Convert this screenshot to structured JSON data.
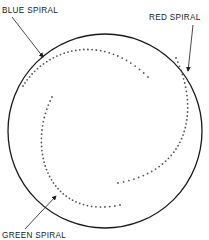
{
  "diagram": {
    "labels": {
      "blue": "BLUE SPIRAL",
      "red": "RED SPIRAL",
      "green": "GREEN SPIRAL"
    },
    "spirals": [
      {
        "name": "blue",
        "color_name": "blue"
      },
      {
        "name": "red",
        "color_name": "red"
      },
      {
        "name": "green",
        "color_name": "green"
      }
    ],
    "colors": {
      "outline": "#1a1a1a",
      "dots": "#555555",
      "text": "#222222"
    }
  }
}
